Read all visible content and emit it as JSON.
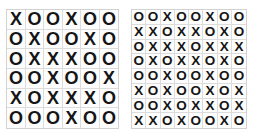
{
  "page": {
    "background_color": "#ffffff"
  },
  "style": {
    "glyph_color": "#151515",
    "gridline_color": "#dcdcdc",
    "border_color": "#d2d2d2",
    "cell_background": "#fdfdfd"
  },
  "grids": [
    {
      "id": "left",
      "name": "left-grid",
      "rows": 6,
      "cols": 6,
      "cells": [
        [
          "X",
          "O",
          "O",
          "X",
          "O",
          "O"
        ],
        [
          "O",
          "X",
          "O",
          "O",
          "X",
          "O"
        ],
        [
          "O",
          "X",
          "X",
          "X",
          "O",
          "O"
        ],
        [
          "O",
          "O",
          "X",
          "O",
          "O",
          "X"
        ],
        [
          "X",
          "O",
          "X",
          "X",
          "X",
          "O"
        ],
        [
          "O",
          "O",
          "O",
          "X",
          "O",
          "O"
        ]
      ]
    },
    {
      "id": "right",
      "name": "right-grid",
      "rows": 8,
      "cols": 8,
      "cells": [
        [
          "O",
          "O",
          "X",
          "O",
          "O",
          "X",
          "O",
          "O"
        ],
        [
          "X",
          "X",
          "O",
          "X",
          "X",
          "O",
          "X",
          "O"
        ],
        [
          "O",
          "X",
          "X",
          "X",
          "O",
          "X",
          "X",
          "X"
        ],
        [
          "O",
          "X",
          "O",
          "X",
          "X",
          "O",
          "X",
          "O"
        ],
        [
          "O",
          "O",
          "X",
          "O",
          "O",
          "X",
          "O",
          "O"
        ],
        [
          "X",
          "O",
          "X",
          "O",
          "O",
          "X",
          "O",
          "X"
        ],
        [
          "O",
          "O",
          "X",
          "O",
          "X",
          "X",
          "O",
          "X"
        ],
        [
          "X",
          "X",
          "O",
          "X",
          "O",
          "O",
          "X",
          "O"
        ]
      ]
    }
  ]
}
